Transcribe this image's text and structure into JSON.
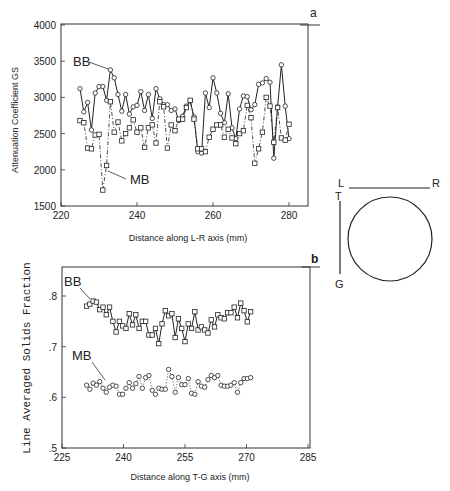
{
  "figure": {
    "diagram": {
      "labels": {
        "L": "L",
        "R": "R",
        "T": "T",
        "G": "G"
      }
    }
  },
  "chart_data": [
    {
      "panel": "a",
      "type": "line",
      "title": "",
      "xlabel": "Distance along L-R axis  (mm)",
      "ylabel": "Attenuation Coefficient  GS",
      "xlim": [
        220,
        285
      ],
      "ylim": [
        1500,
        4000
      ],
      "xticks": [
        220,
        240,
        260,
        280
      ],
      "yticks": [
        1500,
        2000,
        2500,
        3000,
        3500,
        4000
      ],
      "grid": false,
      "series": [
        {
          "name": "BB",
          "marker": "circle",
          "line": "solid",
          "x": [
            225,
            226,
            227,
            228,
            229,
            230,
            231,
            232,
            233,
            234,
            235,
            236,
            237,
            238,
            239,
            240,
            241,
            242,
            243,
            244,
            245,
            246,
            247,
            248,
            249,
            250,
            251,
            252,
            253,
            254,
            255,
            256,
            257,
            258,
            259,
            260,
            261,
            262,
            263,
            264,
            265,
            266,
            267,
            268,
            269,
            270,
            271,
            272,
            273,
            274,
            275,
            276,
            277,
            278,
            279,
            280
          ],
          "values": [
            3120,
            2800,
            2930,
            2550,
            3060,
            3150,
            3150,
            2960,
            3380,
            3270,
            3040,
            2810,
            3040,
            2770,
            2870,
            2890,
            3080,
            2820,
            3040,
            2710,
            3120,
            2980,
            2900,
            2900,
            2820,
            2840,
            2680,
            2740,
            2880,
            2950,
            2730,
            2250,
            2230,
            3060,
            2860,
            3270,
            3060,
            2780,
            2650,
            3050,
            2580,
            2430,
            2840,
            3020,
            3010,
            2830,
            2900,
            3180,
            3200,
            3260,
            3210,
            2160,
            2870,
            3450,
            2880,
            2430
          ]
        },
        {
          "name": "MB",
          "marker": "square",
          "line": "dash-dot",
          "x": [
            225,
            226,
            227,
            228,
            229,
            230,
            231,
            232,
            233,
            234,
            235,
            236,
            237,
            238,
            239,
            240,
            241,
            242,
            243,
            244,
            245,
            246,
            247,
            248,
            249,
            250,
            251,
            252,
            253,
            254,
            255,
            256,
            257,
            258,
            259,
            260,
            261,
            262,
            263,
            264,
            265,
            266,
            267,
            268,
            269,
            270,
            271,
            272,
            273,
            274,
            275,
            276,
            277,
            278,
            279,
            280
          ],
          "values": [
            2680,
            2650,
            2300,
            2290,
            2480,
            2490,
            1720,
            2060,
            2940,
            2520,
            2660,
            2400,
            2500,
            2580,
            2690,
            2520,
            2580,
            2310,
            2580,
            2620,
            2370,
            2940,
            2870,
            2300,
            2620,
            2540,
            2700,
            2700,
            2860,
            2960,
            2700,
            2290,
            2290,
            2250,
            2450,
            2560,
            2620,
            2620,
            2450,
            2560,
            2440,
            2360,
            2500,
            2540,
            2890,
            2720,
            2090,
            2290,
            2520,
            3000,
            2880,
            2380,
            2860,
            2440,
            2410,
            2630
          ]
        }
      ],
      "annotations": [
        "BB",
        "MB",
        "a"
      ]
    },
    {
      "panel": "b",
      "type": "line",
      "title": "",
      "xlabel": "Distance along T-G axis  (mm)",
      "ylabel": "Line Averaged Solids Fraction",
      "xlim": [
        225,
        285
      ],
      "ylim": [
        0.5,
        0.85
      ],
      "xticks": [
        225,
        240,
        255,
        270,
        285
      ],
      "yticks": [
        0.5,
        0.6,
        0.7,
        0.8
      ],
      "ytick_labels": [
        ".5",
        ".6",
        ".7",
        ".8"
      ],
      "grid": false,
      "series": [
        {
          "name": "BB",
          "marker": "square",
          "line": "solid",
          "x": [
            231,
            231.8,
            232.6,
            233.4,
            234.2,
            235,
            235.8,
            236.6,
            237.4,
            238.2,
            239,
            239.8,
            240.6,
            241.4,
            242.2,
            243,
            243.8,
            244.6,
            245.4,
            246.2,
            247,
            247.8,
            248.6,
            249.4,
            250.2,
            251,
            251.8,
            252.6,
            253.4,
            254.2,
            255,
            255.8,
            256.6,
            257.4,
            258.2,
            259,
            259.8,
            260.6,
            261.4,
            262.2,
            263,
            263.8,
            264.6,
            265.4,
            266.2,
            267,
            267.8,
            268.6,
            269.4,
            270.2,
            271
          ],
          "values": [
            0.78,
            0.784,
            0.79,
            0.788,
            0.773,
            0.778,
            0.763,
            0.778,
            0.75,
            0.729,
            0.75,
            0.741,
            0.736,
            0.765,
            0.743,
            0.763,
            0.736,
            0.75,
            0.75,
            0.723,
            0.723,
            0.736,
            0.706,
            0.745,
            0.771,
            0.761,
            0.765,
            0.718,
            0.755,
            0.736,
            0.71,
            0.745,
            0.736,
            0.769,
            0.733,
            0.739,
            0.733,
            0.727,
            0.753,
            0.739,
            0.763,
            0.757,
            0.755,
            0.767,
            0.767,
            0.778,
            0.757,
            0.786,
            0.771,
            0.749,
            0.769
          ]
        },
        {
          "name": "MB",
          "marker": "circle",
          "line": "dotted",
          "x": [
            231,
            231.8,
            232.6,
            233.4,
            234.2,
            235,
            235.8,
            236.6,
            237.4,
            238.2,
            239,
            239.8,
            240.6,
            241.4,
            242.2,
            243,
            243.8,
            244.6,
            245.4,
            246.2,
            247,
            247.8,
            248.6,
            249.4,
            250.2,
            251,
            251.8,
            252.6,
            253.4,
            254.2,
            255,
            255.8,
            256.6,
            257.4,
            258.2,
            259,
            259.8,
            260.6,
            261.4,
            262.2,
            263,
            263.8,
            264.6,
            265.4,
            266.2,
            267,
            267.8,
            268.6,
            269.4,
            270.2,
            271
          ],
          "values": [
            0.624,
            0.616,
            0.628,
            0.624,
            0.631,
            0.618,
            0.61,
            0.62,
            0.624,
            0.622,
            0.606,
            0.606,
            0.618,
            0.629,
            0.618,
            0.627,
            0.641,
            0.618,
            0.639,
            0.643,
            0.614,
            0.606,
            0.618,
            0.616,
            0.616,
            0.655,
            0.641,
            0.61,
            0.639,
            0.625,
            0.625,
            0.637,
            0.608,
            0.606,
            0.631,
            0.622,
            0.62,
            0.635,
            0.643,
            0.639,
            0.643,
            0.624,
            0.622,
            0.622,
            0.624,
            0.629,
            0.61,
            0.629,
            0.637,
            0.637,
            0.639
          ]
        }
      ],
      "annotations": [
        "BB",
        "MB",
        "b"
      ]
    }
  ]
}
